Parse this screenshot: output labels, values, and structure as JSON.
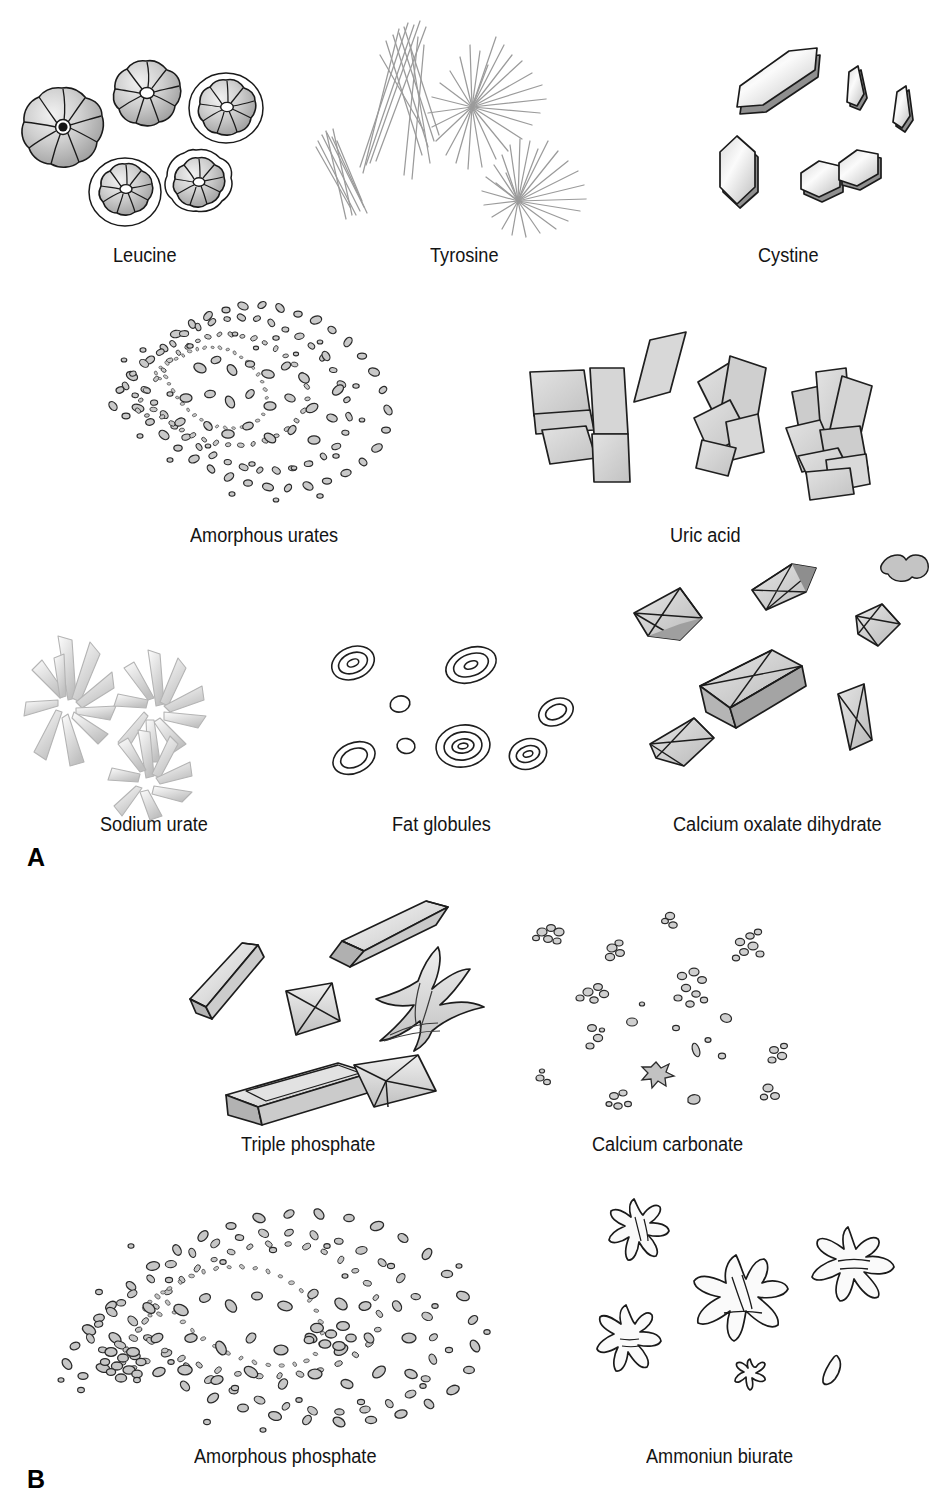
{
  "figure": {
    "panels": [
      {
        "letter": "A"
      },
      {
        "letter": "B"
      }
    ],
    "specimens": [
      {
        "label": "Leucine",
        "panel": "A",
        "row": 1,
        "col": 1
      },
      {
        "label": "Tyrosine",
        "panel": "A",
        "row": 1,
        "col": 2
      },
      {
        "label": "Cystine",
        "panel": "A",
        "row": 1,
        "col": 3
      },
      {
        "label": "Amorphous urates",
        "panel": "A",
        "row": 2,
        "col": 1
      },
      {
        "label": "Uric acid",
        "panel": "A",
        "row": 2,
        "col": 2
      },
      {
        "label": "Sodium urate",
        "panel": "A",
        "row": 3,
        "col": 1
      },
      {
        "label": "Fat globules",
        "panel": "A",
        "row": 3,
        "col": 2
      },
      {
        "label": "Calcium oxalate dihydrate",
        "panel": "A",
        "row": 3,
        "col": 3
      },
      {
        "label": "Triple phosphate",
        "panel": "B",
        "row": 1,
        "col": 1
      },
      {
        "label": "Calcium carbonate",
        "panel": "B",
        "row": 1,
        "col": 2
      },
      {
        "label": "Amorphous phosphate",
        "panel": "B",
        "row": 2,
        "col": 1
      },
      {
        "label": "Ammoniun biurate",
        "panel": "B",
        "row": 2,
        "col": 2
      }
    ],
    "colors": {
      "ink": "#1a1a1a",
      "crystal_fill_light": "#ededed",
      "crystal_fill_mid": "#d4d4d4",
      "crystal_fill_dark": "#b0b0b0",
      "granule_fill": "#c9c9c9",
      "needle_stroke": "#9a9a9a",
      "background": "#ffffff"
    }
  }
}
